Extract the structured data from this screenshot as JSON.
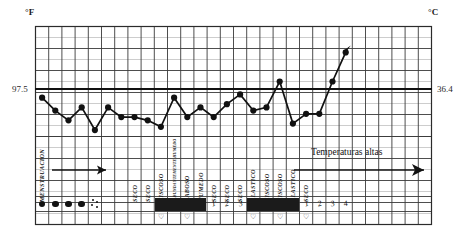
{
  "axes": {
    "left_unit": "°F",
    "right_unit": "°C",
    "left_value": "97.5",
    "right_value": "36.4"
  },
  "annotations": {
    "high_temps_note": "Temperaturas altas",
    "menstruation_label": "MENSTRUACION"
  },
  "mucus_labels": [
    {
      "col": 0,
      "text": "MENSTRUACION",
      "size": "normal"
    },
    {
      "col": 7,
      "text": "SECO",
      "size": "normal"
    },
    {
      "col": 8,
      "text": "SECO",
      "size": "normal"
    },
    {
      "col": 9,
      "text": "VISCOSO",
      "size": "normal"
    },
    {
      "col": 10,
      "text": "ABUNDANTEMENTE HUMEDO",
      "size": "tiny"
    },
    {
      "col": 11,
      "text": "BABOSO",
      "size": "normal"
    },
    {
      "col": 12,
      "text": "HUMEDO",
      "size": "normal"
    },
    {
      "col": 13,
      "text": "SECO",
      "size": "normal"
    },
    {
      "col": 14,
      "text": "SECO",
      "size": "normal"
    },
    {
      "col": 15,
      "text": "SECO",
      "size": "normal"
    },
    {
      "col": 16,
      "text": "ELASTICO",
      "size": "normal"
    },
    {
      "col": 17,
      "text": "VISCOSO",
      "size": "normal"
    },
    {
      "col": 18,
      "text": "VISCOSO",
      "size": "normal"
    },
    {
      "col": 19,
      "text": "ELASTICO",
      "size": "normal"
    },
    {
      "col": 20,
      "text": "SECO",
      "size": "normal"
    }
  ],
  "record_row": {
    "bleeding_dots": [
      0,
      1,
      2,
      3
    ],
    "spotting_cell": 4,
    "black_blocks": [
      [
        9,
        12
      ],
      [
        16,
        19
      ]
    ],
    "day_numbers": [
      {
        "col": 13,
        "text": "1"
      },
      {
        "col": 14,
        "text": "2"
      },
      {
        "col": 15,
        "text": "3"
      },
      {
        "col": 20,
        "text": "1"
      },
      {
        "col": 21,
        "text": "2"
      },
      {
        "col": 22,
        "text": "3"
      },
      {
        "col": 23,
        "text": "4"
      }
    ]
  },
  "heart_row": [
    9,
    11,
    16,
    18,
    20
  ],
  "chart_data": {
    "type": "line",
    "title": "",
    "xlabel": "",
    "ylabel": "",
    "grid": true,
    "legend": false,
    "reference_line": {
      "label_left": "97.5",
      "label_right": "36.4",
      "value": 97.5
    },
    "ylim": [
      96.9,
      98.6
    ],
    "x": [
      0,
      1,
      2,
      3,
      4,
      5,
      6,
      7,
      8,
      9,
      10,
      11,
      12,
      13,
      14,
      15,
      16,
      17,
      18,
      19,
      20,
      21,
      22,
      23
    ],
    "values": [
      97.5,
      97.3,
      97.15,
      97.35,
      97.0,
      97.35,
      97.2,
      97.2,
      97.15,
      97.05,
      97.5,
      97.2,
      97.35,
      97.2,
      97.4,
      97.55,
      97.3,
      97.35,
      97.75,
      97.1,
      97.25,
      97.25,
      97.75,
      98.2
    ],
    "units": {
      "left": "°F",
      "right": "°C"
    }
  }
}
